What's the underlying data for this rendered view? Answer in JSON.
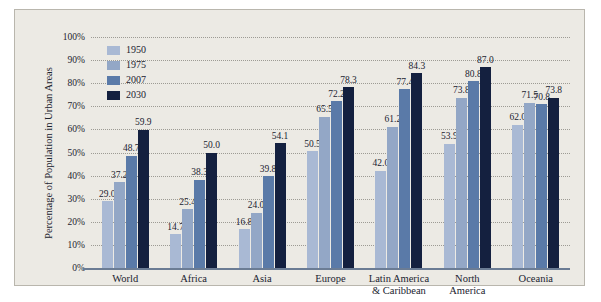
{
  "chart_data": {
    "type": "bar",
    "title": "",
    "xlabel": "",
    "ylabel": "Percentage of Population in Urban Areas",
    "ylim": [
      0,
      100
    ],
    "ytick_labels": [
      "0%",
      "10%",
      "20%",
      "30%",
      "40%",
      "50%",
      "60%",
      "70%",
      "80%",
      "90%",
      "100%"
    ],
    "ytick_values": [
      0,
      10,
      20,
      30,
      40,
      50,
      60,
      70,
      80,
      90,
      100
    ],
    "grid": true,
    "legend_position": "inside-top-left",
    "categories": [
      "World",
      "Africa",
      "Asia",
      "Europe",
      "Latin America\n& Caribbean",
      "North\nAmerica",
      "Oceania"
    ],
    "category_lines": [
      [
        "World"
      ],
      [
        "Africa"
      ],
      [
        "Asia"
      ],
      [
        "Europe"
      ],
      [
        "Latin America",
        "& Caribbean"
      ],
      [
        "North",
        "America"
      ],
      [
        "Oceania"
      ]
    ],
    "series": [
      {
        "name": "1950",
        "color": "#a9b9d4",
        "values": [
          29.0,
          14.7,
          16.8,
          50.5,
          42.0,
          53.9,
          62.0
        ],
        "labels": [
          "29.0",
          "14.7",
          "16.8",
          "50.5",
          "42.0",
          "53.9",
          "62.0"
        ]
      },
      {
        "name": "1975",
        "color": "#93a7c6",
        "values": [
          37.2,
          25.4,
          24.0,
          65.5,
          61.2,
          73.8,
          71.5
        ],
        "labels": [
          "37.2",
          "25.4",
          "24.0",
          "65.5",
          "61.2",
          "73.8",
          "71.5"
        ]
      },
      {
        "name": "2007",
        "color": "#5a7aa8",
        "values": [
          48.7,
          38.3,
          39.8,
          72.2,
          77.4,
          80.8,
          70.8
        ],
        "labels": [
          "48.7",
          "38.3",
          "39.8",
          "72.2",
          "77.4",
          "80.8",
          "70.8"
        ]
      },
      {
        "name": "2030",
        "color": "#14203f",
        "values": [
          59.9,
          50.0,
          54.1,
          78.3,
          84.3,
          87.0,
          73.8
        ],
        "labels": [
          "59.9",
          "50.0",
          "54.1",
          "78.3",
          "84.3",
          "87.0",
          "73.8"
        ]
      }
    ]
  },
  "colors": {
    "panel_background": "#eceae4",
    "panel_border": "#b9b6ad",
    "gridline": "#9d9b94",
    "axis_line": "#6b7c94",
    "text": "#1b2330"
  }
}
